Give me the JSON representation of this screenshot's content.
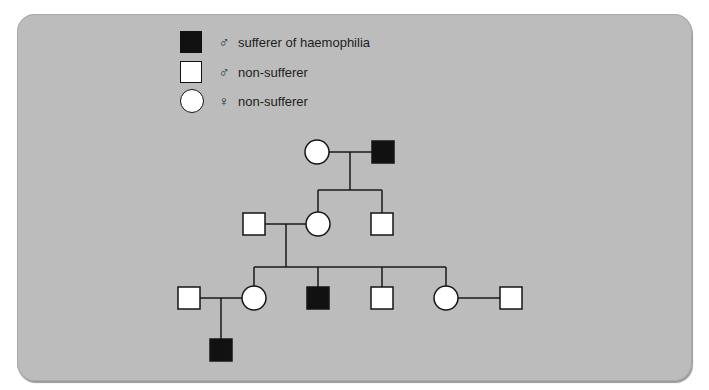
{
  "legend": [
    {
      "symbol": "filled-square",
      "sex_symbol": "♂",
      "label": "sufferer of haemophilia"
    },
    {
      "symbol": "open-square",
      "sex_symbol": "♂",
      "label": "non-sufferer"
    },
    {
      "symbol": "open-circle",
      "sex_symbol": "♀",
      "label": "non-sufferer"
    }
  ],
  "pedigree": {
    "generations": [
      {
        "name": "I",
        "individuals": [
          {
            "id": "I-1",
            "sex": "female",
            "affected": false
          },
          {
            "id": "I-2",
            "sex": "male",
            "affected": true
          }
        ]
      },
      {
        "name": "II",
        "individuals": [
          {
            "id": "II-1",
            "sex": "male",
            "affected": false,
            "note": "married in"
          },
          {
            "id": "II-2",
            "sex": "female",
            "affected": false,
            "parents": [
              "I-1",
              "I-2"
            ]
          },
          {
            "id": "II-3",
            "sex": "male",
            "affected": false,
            "parents": [
              "I-1",
              "I-2"
            ]
          }
        ]
      },
      {
        "name": "III",
        "individuals": [
          {
            "id": "III-1",
            "sex": "male",
            "affected": false,
            "note": "married in"
          },
          {
            "id": "III-2",
            "sex": "female",
            "affected": false,
            "parents": [
              "II-1",
              "II-2"
            ]
          },
          {
            "id": "III-3",
            "sex": "male",
            "affected": true,
            "parents": [
              "II-1",
              "II-2"
            ]
          },
          {
            "id": "III-4",
            "sex": "male",
            "affected": false,
            "parents": [
              "II-1",
              "II-2"
            ]
          },
          {
            "id": "III-5",
            "sex": "female",
            "affected": false,
            "parents": [
              "II-1",
              "II-2"
            ]
          },
          {
            "id": "III-6",
            "sex": "male",
            "affected": false,
            "note": "married in"
          }
        ]
      },
      {
        "name": "IV",
        "individuals": [
          {
            "id": "IV-1",
            "sex": "male",
            "affected": true,
            "parents": [
              "III-1",
              "III-2"
            ]
          }
        ]
      }
    ],
    "couples": [
      [
        "I-1",
        "I-2"
      ],
      [
        "II-1",
        "II-2"
      ],
      [
        "III-1",
        "III-2"
      ],
      [
        "III-5",
        "III-6"
      ]
    ]
  },
  "colors": {
    "background": "#bcbcbc",
    "affected": "#111111",
    "unaffected": "#ffffff",
    "line": "#1a1a1a"
  }
}
